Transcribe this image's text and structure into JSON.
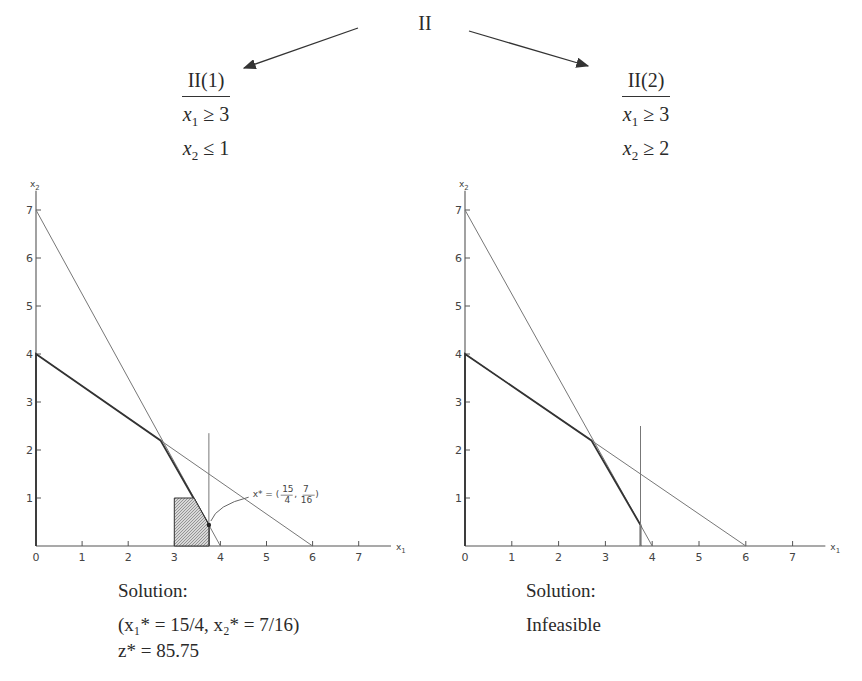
{
  "tree": {
    "root_label": "II",
    "children": [
      {
        "label": "II(1)",
        "constraints": [
          {
            "var": "x",
            "sub": "1",
            "op": "≥",
            "rhs": "3"
          },
          {
            "var": "x",
            "sub": "2",
            "op": "≤",
            "rhs": "1"
          }
        ]
      },
      {
        "label": "II(2)",
        "constraints": [
          {
            "var": "x",
            "sub": "1",
            "op": "≥",
            "rhs": "3"
          },
          {
            "var": "x",
            "sub": "2",
            "op": "≥",
            "rhs": "2"
          }
        ]
      }
    ]
  },
  "solutions": [
    {
      "heading": "Solution:",
      "line1": "(x₁* = 15/4, x₂* = 7/16)",
      "line2": "z* = 85.75"
    },
    {
      "heading": "Solution:",
      "line1": "Infeasible"
    }
  ],
  "chart_data": [
    {
      "type": "line",
      "title": "II(1)",
      "xlabel": "x1",
      "ylabel": "x2",
      "xlim": [
        0,
        7.7
      ],
      "ylim": [
        0,
        7.4
      ],
      "xticks": [
        "0",
        "1",
        "2",
        "3",
        "4",
        "5",
        "6",
        "7"
      ],
      "yticks": [
        "1",
        "2",
        "3",
        "4",
        "5",
        "6",
        "7"
      ],
      "grid": false,
      "series": [
        {
          "name": "constraint 7x1+4x2<=28",
          "points": [
            [
              0,
              7
            ],
            [
              4,
              0
            ]
          ],
          "style": "thin"
        },
        {
          "name": "constraint 2x1+3x2<=12",
          "points": [
            [
              0,
              4
            ],
            [
              6,
              0
            ]
          ],
          "style": "thin"
        },
        {
          "name": "original feasible boundary",
          "points": [
            [
              0,
              0
            ],
            [
              0,
              4
            ],
            [
              2.7,
              2.2
            ],
            [
              3.75,
              0.4375
            ],
            [
              3.75,
              0
            ]
          ],
          "style": "bold"
        },
        {
          "name": "branch line x1=3.75",
          "points": [
            [
              3.75,
              0
            ],
            [
              3.75,
              2.35
            ]
          ],
          "style": "thin"
        },
        {
          "name": "feasible region II(1)",
          "points": [
            [
              3,
              0
            ],
            [
              3,
              1
            ],
            [
              3.43,
              1
            ],
            [
              3.75,
              0.4375
            ],
            [
              3.75,
              0
            ]
          ],
          "style": "hatched"
        }
      ],
      "annotations": [
        {
          "text": "x* = (15/4, 7/16)",
          "at": [
            3.75,
            0.4375
          ],
          "label_pos": [
            4.7,
            1.1
          ]
        }
      ]
    },
    {
      "type": "line",
      "title": "II(2)",
      "xlabel": "x1",
      "ylabel": "x2",
      "xlim": [
        0,
        7.7
      ],
      "ylim": [
        0,
        7.4
      ],
      "xticks": [
        "0",
        "1",
        "2",
        "3",
        "4",
        "5",
        "6",
        "7"
      ],
      "yticks": [
        "1",
        "2",
        "3",
        "4",
        "5",
        "6",
        "7"
      ],
      "grid": false,
      "series": [
        {
          "name": "constraint 7x1+4x2<=28",
          "points": [
            [
              0,
              7
            ],
            [
              4,
              0
            ]
          ],
          "style": "thin"
        },
        {
          "name": "constraint 2x1+3x2<=12",
          "points": [
            [
              0,
              4
            ],
            [
              6,
              0
            ]
          ],
          "style": "thin"
        },
        {
          "name": "original feasible boundary",
          "points": [
            [
              0,
              0
            ],
            [
              0,
              4
            ],
            [
              2.7,
              2.2
            ],
            [
              3.75,
              0.4375
            ],
            [
              3.75,
              0
            ]
          ],
          "style": "bold"
        },
        {
          "name": "branch line x1=3.75",
          "points": [
            [
              3.75,
              0
            ],
            [
              3.75,
              2.5
            ]
          ],
          "style": "thin"
        }
      ],
      "annotations": []
    }
  ]
}
